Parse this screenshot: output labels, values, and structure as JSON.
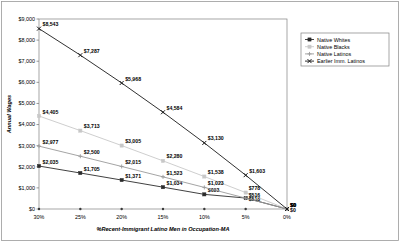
{
  "chart_data": {
    "type": "line",
    "title": "",
    "xlabel": "%Recent-Immigrant Latino Men in Occupation-MA",
    "ylabel": "Annual Wages",
    "categories": [
      "30%",
      "25%",
      "20%",
      "15%",
      "10%",
      "5%",
      "0%"
    ],
    "x": [
      30,
      25,
      20,
      15,
      10,
      5,
      0
    ],
    "xlim": [
      30,
      0
    ],
    "ylim": [
      0,
      9000
    ],
    "yticks": [
      0,
      1000,
      2000,
      3000,
      4000,
      5000,
      6000,
      7000,
      8000,
      9000
    ],
    "ytick_labels": [
      "$0",
      "$1,000",
      "$2,000",
      "$3,000",
      "$4,000",
      "$5,000",
      "$6,000",
      "$7,000",
      "$8,000",
      "$9,000"
    ],
    "grid": false,
    "legend_position": "right",
    "series": [
      {
        "name": "Native Whites",
        "color": "#2b2b2b",
        "marker": "square",
        "values": [
          2035,
          1705,
          1371,
          1034,
          693,
          518,
          0
        ],
        "labels": [
          "$2,035",
          "$1,705",
          "$1,371",
          "$1,034",
          "$693",
          "$518",
          "$0"
        ]
      },
      {
        "name": "Native Blacks",
        "color": "#c8c8c8",
        "marker": "square",
        "values": [
          4405,
          3713,
          3005,
          2280,
          1538,
          778,
          0
        ],
        "labels": [
          "$4,405",
          "$3,713",
          "$3,005",
          "$2,280",
          "$1,538",
          "$778",
          "$0"
        ]
      },
      {
        "name": "Native Latinos",
        "color": "#9a9a9a",
        "marker": "cross",
        "values": [
          2977,
          2500,
          2015,
          1523,
          1023,
          516,
          0
        ],
        "labels": [
          "$2,977",
          "$2,500",
          "$2,015",
          "$1,523",
          "$1,023",
          "$516",
          "$0"
        ]
      },
      {
        "name": "Earlier Imm. Latinos",
        "color": "#1a1a1a",
        "marker": "x-square",
        "values": [
          8543,
          7287,
          5968,
          4584,
          3130,
          1603,
          0
        ],
        "labels": [
          "$8,543",
          "$7,287",
          "$5,968",
          "$4,584",
          "$3,130",
          "$1,603",
          "$0"
        ]
      }
    ]
  },
  "legend": {
    "items": [
      {
        "label": "Native Whites"
      },
      {
        "label": "Native Blacks"
      },
      {
        "label": "Native Latinos"
      },
      {
        "label": "Earlier Imm. Latinos"
      }
    ]
  }
}
